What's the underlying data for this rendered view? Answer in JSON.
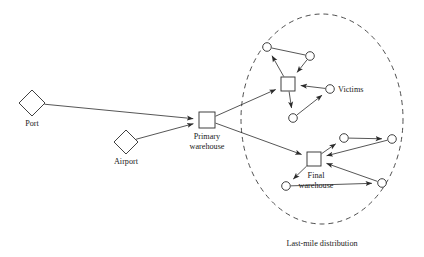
{
  "diagram": {
    "background_color": "#ffffff",
    "stroke_color": "#2b2b2b",
    "region": {
      "label": "Last-mile distribution",
      "style": "dashed-ellipse",
      "cx": 322,
      "cy": 119,
      "rx": 81,
      "ry": 105,
      "label_x": 322,
      "label_y": 246
    },
    "nodes": [
      {
        "id": "port",
        "label": "Port",
        "shape": "diamond",
        "x": 32,
        "y": 103,
        "size": 13,
        "label_x": 32,
        "label_y": 126
      },
      {
        "id": "airport",
        "label": "Airport",
        "shape": "diamond",
        "x": 126,
        "y": 142,
        "size": 12,
        "label_x": 126,
        "label_y": 164
      },
      {
        "id": "primary-warehouse",
        "label_line1": "Primary",
        "label_line2": "warehouse",
        "shape": "square",
        "x": 207,
        "y": 120,
        "size": 16,
        "label_x": 207,
        "label_y": 139
      },
      {
        "id": "victims-hub",
        "label": "",
        "shape": "square",
        "x": 288,
        "y": 84,
        "size": 14
      },
      {
        "id": "final-warehouse",
        "label_line1": "Final",
        "label_line2": "warehouse",
        "shape": "square",
        "x": 314,
        "y": 159,
        "size": 14,
        "label_x": 316,
        "label_y": 178
      },
      {
        "id": "victim-1",
        "shape": "circle",
        "x": 267,
        "y": 47,
        "r": 4.3
      },
      {
        "id": "victim-2",
        "shape": "circle",
        "x": 310,
        "y": 56,
        "r": 4.3
      },
      {
        "id": "victim-3",
        "shape": "circle",
        "x": 330,
        "y": 89,
        "r": 4.3
      },
      {
        "id": "victim-4",
        "shape": "circle",
        "x": 293,
        "y": 118,
        "r": 4.3
      },
      {
        "id": "beneficiary-1",
        "shape": "circle",
        "x": 344,
        "y": 138,
        "r": 4.3
      },
      {
        "id": "beneficiary-2",
        "shape": "circle",
        "x": 392,
        "y": 139,
        "r": 4.3
      },
      {
        "id": "beneficiary-3",
        "shape": "circle",
        "x": 286,
        "y": 186,
        "r": 4.3
      },
      {
        "id": "beneficiary-4",
        "shape": "circle",
        "x": 382,
        "y": 183,
        "r": 4.3
      }
    ],
    "victims_label": {
      "text": "Victims",
      "x": 338,
      "y": 92
    },
    "edges": [
      {
        "id": "port-to-primary",
        "from": "port",
        "to": "primary-warehouse",
        "arrow": true
      },
      {
        "id": "airport-to-primary",
        "from": "airport",
        "to": "primary-warehouse",
        "arrow": true
      },
      {
        "id": "primary-to-victims-hub",
        "from": "primary-warehouse",
        "to": "victims-hub",
        "arrow": true
      },
      {
        "id": "primary-to-final",
        "from": "primary-warehouse",
        "to": "final-warehouse",
        "arrow": true
      },
      {
        "id": "victimshub-to-victim1",
        "from": "victims-hub",
        "to": "victim-1",
        "arrow": true
      },
      {
        "id": "victim1-to-victim2",
        "from": "victim-1",
        "to": "victim-2",
        "arrow": false
      },
      {
        "id": "victim2-to-victimshub",
        "from": "victim-2",
        "to": "victims-hub",
        "arrow": true
      },
      {
        "id": "victimshub-to-victim4",
        "from": "victims-hub",
        "to": "victim-4",
        "arrow": true
      },
      {
        "id": "victim4-to-victim3",
        "from": "victim-4",
        "to": "victim-3",
        "arrow": true
      },
      {
        "id": "victim3-to-victimshub",
        "from": "victim-3",
        "to": "victims-hub",
        "arrow": true
      },
      {
        "id": "final-to-beneficiary1",
        "from": "final-warehouse",
        "to": "beneficiary-1",
        "arrow": true
      },
      {
        "id": "beneficiary1-to-beneficiary2",
        "from": "beneficiary-1",
        "to": "beneficiary-2",
        "arrow": true
      },
      {
        "id": "beneficiary2-to-final",
        "from": "beneficiary-2",
        "to": "final-warehouse",
        "arrow": true
      },
      {
        "id": "final-to-beneficiary3",
        "from": "final-warehouse",
        "to": "beneficiary-3",
        "arrow": true
      },
      {
        "id": "beneficiary3-to-beneficiary4",
        "from": "beneficiary-3",
        "to": "beneficiary-4",
        "arrow": true
      },
      {
        "id": "beneficiary4-to-final",
        "from": "beneficiary-4",
        "to": "final-warehouse",
        "arrow": true
      }
    ]
  }
}
